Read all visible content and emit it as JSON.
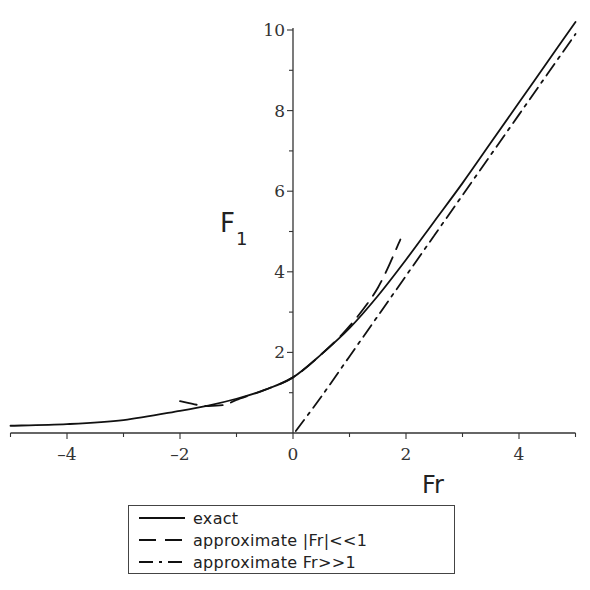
{
  "chart_data": {
    "type": "line",
    "title": "",
    "xlabel": "Fr",
    "ylabel": "F_1",
    "ylabel_main": "F",
    "ylabel_sub": "1",
    "xlim": [
      -5,
      5
    ],
    "ylim": [
      0,
      10
    ],
    "x_ticks": [
      -4,
      -2,
      0,
      2,
      4
    ],
    "y_ticks": [
      2,
      4,
      6,
      8,
      10
    ],
    "grid": false,
    "legend_position": "below",
    "series": [
      {
        "name": "exact",
        "style": "solid",
        "x": [
          -5,
          -4,
          -3,
          -2,
          -1.5,
          -1,
          -0.5,
          0,
          0.5,
          1,
          1.5,
          2,
          2.5,
          3,
          3.5,
          4,
          4.5,
          5
        ],
        "y": [
          0.18,
          0.22,
          0.32,
          0.55,
          0.68,
          0.85,
          1.07,
          1.38,
          1.95,
          2.6,
          3.4,
          4.3,
          5.25,
          6.2,
          7.2,
          8.2,
          9.2,
          10.2
        ]
      },
      {
        "name": "approximate |Fr|<<1",
        "style": "dashed",
        "x": [
          -2,
          -1.7,
          -1.5,
          -1.2,
          -1,
          -0.5,
          0,
          0.5,
          1,
          1.5,
          1.9
        ],
        "y": [
          0.79,
          0.7,
          0.67,
          0.7,
          0.82,
          1.07,
          1.38,
          1.95,
          2.65,
          3.6,
          4.8
        ]
      },
      {
        "name": "approximate Fr>>1",
        "style": "dashdot",
        "x": [
          0.05,
          0.5,
          1,
          1.5,
          2,
          2.5,
          3,
          3.5,
          4,
          4.5,
          5
        ],
        "y": [
          0.05,
          0.9,
          1.9,
          2.9,
          3.9,
          4.9,
          5.9,
          6.9,
          7.9,
          8.9,
          9.9
        ]
      }
    ]
  },
  "legend": {
    "items": [
      {
        "label": "exact",
        "style": "solid"
      },
      {
        "label": "approximate |Fr|<<1",
        "style": "dashed"
      },
      {
        "label": "approximate Fr>>1",
        "style": "dashdot"
      }
    ]
  },
  "colors": {
    "line": "#111111",
    "axis": "#333333",
    "background": "#ffffff"
  }
}
